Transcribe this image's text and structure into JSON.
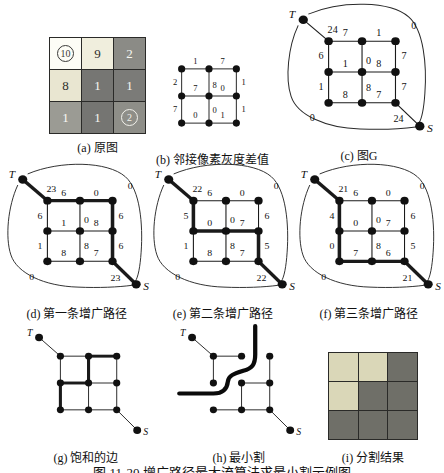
{
  "caption": "图 11-20  增广路径最大流算法求最小割示例图",
  "panels": {
    "a": {
      "caption": "(a) 原图",
      "cells": [
        {
          "t": "10",
          "circled": true,
          "bg": "#fdfdf6",
          "fg": "#3a3a38"
        },
        {
          "t": "9",
          "bg": "#f0eedd",
          "fg": "#2e2e2c"
        },
        {
          "t": "2",
          "bg": "#8b8b86",
          "fg": "#f6f6f1"
        },
        {
          "t": "8",
          "bg": "#e9e6d1",
          "fg": "#2e2e2c"
        },
        {
          "t": "1",
          "bg": "#767673",
          "fg": "#f6f6f1"
        },
        {
          "t": "1",
          "bg": "#7b7b78",
          "fg": "#f6f6f1"
        },
        {
          "t": "1",
          "bg": "#9b9b94",
          "fg": "#f8f8f3"
        },
        {
          "t": "1",
          "bg": "#757572",
          "fg": "#f6f6f1"
        },
        {
          "t": "2",
          "circled": true,
          "bg": "#8e8e88",
          "fg": "#f2f2ec"
        }
      ]
    },
    "b": {
      "caption": "(b) 邻接像素灰度差值"
    },
    "c": {
      "caption": "(c) 图G"
    },
    "d": {
      "caption": "(d) 第一条增广路径"
    },
    "e": {
      "caption": "(e) 第二条增广路径"
    },
    "f": {
      "caption": "(f) 第三条增广路径"
    },
    "g": {
      "caption": "(g) 饱和的边"
    },
    "h": {
      "caption": "(h) 最小割"
    },
    "i": {
      "caption": "(i) 分割结果",
      "cells": [
        {
          "bg": "#dad7b8"
        },
        {
          "bg": "#dad7b8"
        },
        {
          "bg": "#6f6f68"
        },
        {
          "bg": "#dad7b8"
        },
        {
          "bg": "#6f6f68"
        },
        {
          "bg": "#6f6f68"
        },
        {
          "bg": "#6f6f68"
        },
        {
          "bg": "#6f6f68"
        },
        {
          "bg": "#6f6f68"
        }
      ]
    }
  },
  "graphs": {
    "b": {
      "has_ts": false,
      "blob": false,
      "labels": {
        "00-01": "1",
        "01-02": "7",
        "00-10": "2",
        "01-11": "8",
        "02-12": "1",
        "10-11": "7",
        "11-12": "0",
        "10-20": "7",
        "11-21": "0",
        "12-22": "1",
        "20-21": "0",
        "21-22": "1"
      },
      "xs": [
        30,
        62,
        94
      ],
      "ys": [
        27,
        59,
        91
      ],
      "vb": "0 0 124 118"
    },
    "c": {
      "has_ts": true,
      "blob": true,
      "t_label": "T",
      "s_label": "S",
      "labels": {
        "T-00": "24",
        "00-01": "7",
        "01-02": "1",
        "00-10": "6",
        "01-11": "0",
        "02-12": "7",
        "10-11": "1",
        "11-12": "8",
        "10-20": "1",
        "11-21": "8",
        "12-22": "7",
        "20-21": "8",
        "21-22": "7",
        "22-S": "24",
        "blob-tr": "0",
        "blob-bl": "0"
      }
    },
    "d": {
      "has_ts": true,
      "blob": true,
      "t_label": "T",
      "s_label": "S",
      "bold": [
        "T-00",
        "00-01",
        "01-02",
        "02-12",
        "12-22",
        "22-S"
      ],
      "labels": {
        "T-00": "23",
        "00-01": "6",
        "01-02": "0",
        "00-10": "6",
        "01-11": "0",
        "02-12": "6",
        "10-11": "1",
        "11-12": "8",
        "10-20": "1",
        "11-21": "8",
        "12-22": "6",
        "20-21": "8",
        "21-22": "7",
        "22-S": "23",
        "blob-tr": "0",
        "blob-bl": "0"
      }
    },
    "e": {
      "has_ts": true,
      "blob": true,
      "t_label": "T",
      "s_label": "S",
      "bold": [
        "T-00",
        "00-10",
        "10-11",
        "11-12",
        "12-22",
        "22-S"
      ],
      "labels": {
        "T-00": "22",
        "00-01": "6",
        "01-02": "0",
        "00-10": "5",
        "01-11": "0",
        "02-12": "6",
        "10-11": "0",
        "11-12": "7",
        "10-20": "1",
        "11-21": "8",
        "12-22": "5",
        "20-21": "8",
        "21-22": "7",
        "22-S": "22",
        "blob-tr": "0",
        "blob-bl": "0"
      }
    },
    "f": {
      "has_ts": true,
      "blob": true,
      "t_label": "T",
      "s_label": "S",
      "bold": [
        "T-00",
        "00-10",
        "10-20",
        "20-21",
        "21-22",
        "22-S"
      ],
      "labels": {
        "T-00": "21",
        "00-01": "6",
        "01-02": "0",
        "00-10": "4",
        "01-11": "0",
        "02-12": "6",
        "10-11": "0",
        "11-12": "7",
        "10-20": "0",
        "11-21": "8",
        "12-22": "5",
        "20-21": "7",
        "21-22": "6",
        "22-S": "21",
        "blob-tr": "0",
        "blob-bl": "0"
      }
    },
    "g": {
      "has_ts": true,
      "blob": false,
      "t_label": "T",
      "s_label": "S",
      "bold": [
        "01-02",
        "01-11",
        "10-11",
        "10-20"
      ],
      "labels": {}
    },
    "h": {
      "has_ts": true,
      "blob": false,
      "t_label": "T",
      "s_label": "S",
      "cut": true,
      "omit": [
        "01-02",
        "01-11",
        "10-11",
        "10-20"
      ],
      "labels": {}
    }
  }
}
